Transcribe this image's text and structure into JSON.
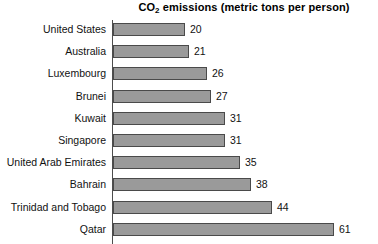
{
  "chart_data": {
    "type": "bar",
    "orientation": "horizontal",
    "title": "CO2 emissions (metric tons per person)",
    "title_prefix": "CO",
    "title_sub": "2",
    "title_suffix": " emissions (metric tons per person)",
    "xlabel": "",
    "ylabel": "",
    "xlim": [
      0,
      61
    ],
    "grid": false,
    "legend": false,
    "bar_color": "#9a9a9a",
    "bar_border_color": "#4a4a4a",
    "axis_color": "#4d4d4d",
    "categories": [
      "United States",
      "Australia",
      "Luxembourg",
      "Brunei",
      "Kuwait",
      "Singapore",
      "United Arab Emirates",
      "Bahrain",
      "Trinidad and Tobago",
      "Qatar"
    ],
    "values": [
      20,
      21,
      26,
      27,
      31,
      31,
      35,
      38,
      44,
      61
    ],
    "value_labels": [
      "20",
      "21",
      "26",
      "27",
      "31",
      "31",
      "35",
      "38",
      "44",
      "61"
    ]
  }
}
